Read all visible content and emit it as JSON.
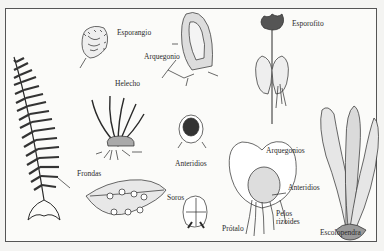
{
  "diagram": {
    "type": "botanical-illustration",
    "labels": {
      "esporangio": "Esporangio",
      "arquegonio": "Arquegonio",
      "esporofito": "Esporofito",
      "helecho": "Helecho",
      "anteridios_top": "Anteridios",
      "frondas": "Frondas",
      "soros": "Soros",
      "arquegonios": "Arquegonios",
      "anteridios_prothallus": "Anteridios",
      "pelos": "Pelos",
      "rizoides": "rizoides",
      "protalo": "Prótalo",
      "escolopendra": "Escolopendra"
    },
    "colors": {
      "ink": "#2a2a2a",
      "paper": "#fbfbf9",
      "frame": "#555555"
    }
  }
}
